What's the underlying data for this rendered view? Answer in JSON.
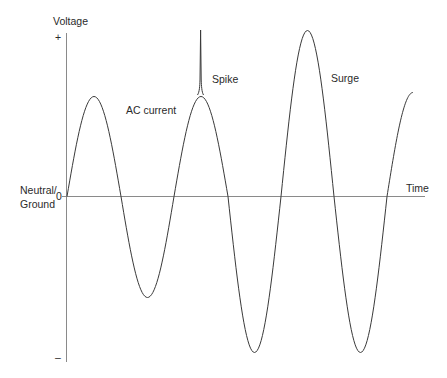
{
  "diagram": {
    "type": "line",
    "title": "",
    "axes": {
      "y_label": "Voltage",
      "y_plus": "+",
      "y_minus": "–",
      "zero_label": "0",
      "x_label": "Time",
      "zero_line_label_line1": "Neutral/",
      "zero_line_label_line2": "Ground"
    },
    "annotations": {
      "ac_current": "AC current",
      "spike": "Spike",
      "surge": "Surge"
    },
    "colors": {
      "axis": "#8a8a8a",
      "wave": "#3a3a3a",
      "text": "#2a2a2a"
    }
  },
  "chart_data": {
    "type": "line",
    "title": "",
    "xlabel": "Time",
    "ylabel": "Voltage",
    "y_ticks": [
      "+",
      "0",
      "–"
    ],
    "zero_line_label": "Neutral/Ground",
    "half_cycles": [
      {
        "start_x": 67,
        "end_x": 121,
        "amplitude": 100,
        "sign": 1
      },
      {
        "start_x": 121,
        "end_x": 174,
        "amplitude": 101,
        "sign": -1
      },
      {
        "start_x": 174,
        "end_x": 228,
        "amplitude": 100,
        "sign": 1
      },
      {
        "start_x": 228,
        "end_x": 281,
        "amplitude": 156,
        "sign": -1
      },
      {
        "start_x": 281,
        "end_x": 334,
        "amplitude": 166,
        "sign": 1
      },
      {
        "start_x": 334,
        "end_x": 387,
        "amplitude": 156,
        "sign": -1
      },
      {
        "start_x": 387,
        "end_x": 413,
        "amplitude": 104,
        "sign": 1,
        "partial": true
      }
    ],
    "events": [
      {
        "label": "AC current",
        "x": 95,
        "kind": "normal cycle"
      },
      {
        "label": "Spike",
        "x": 201,
        "peak_y_px": 30,
        "kind": "transient spike"
      },
      {
        "label": "Surge",
        "x": 307,
        "peak_y_px": 30,
        "kind": "over-voltage surge"
      }
    ]
  }
}
